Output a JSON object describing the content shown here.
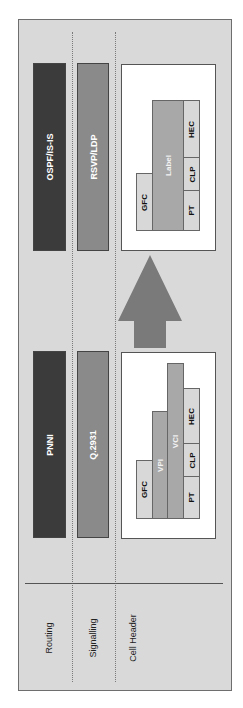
{
  "rows": {
    "routing": "Routing",
    "signalling": "Signalling",
    "cell_header": "Cell Header"
  },
  "mpls": {
    "routing": "OSPF/IS-IS",
    "signalling": "RSVP/LDP",
    "cell_fields": {
      "gfc": "GFC",
      "label": "Label",
      "pt": "PT",
      "clp": "CLP",
      "hec": "HEC"
    }
  },
  "atm": {
    "routing": "PNNI",
    "signalling": "Q.2931",
    "cell_fields": {
      "gfc": "GFC",
      "vpi": "VPI",
      "vci": "VCI",
      "pt": "PT",
      "clp": "CLP",
      "hec": "HEC"
    }
  },
  "arrow": {
    "direction": "atm-to-mpls"
  },
  "colors": {
    "background": "#d9d9d9",
    "routing_bar": "#3b3b3b",
    "signalling_bar": "#8a8a8a",
    "arrow": "#7a7a7a",
    "field_light": "#d8d8d8",
    "field_mid": "#a8a8a8"
  }
}
